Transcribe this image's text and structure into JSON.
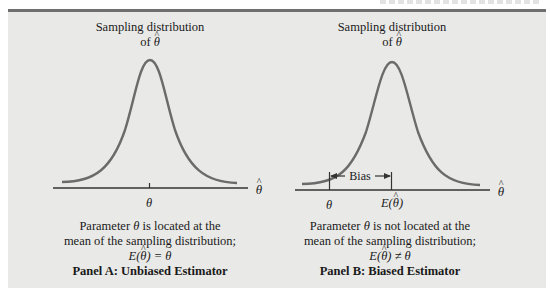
{
  "figure": {
    "background_color": "#e9e9e7",
    "rule_color": "#6f6f6f",
    "curve_color": "#6b6b6b"
  },
  "panel_a": {
    "curve_label_line1": "Sampling distribution",
    "curve_label_line2_prefix": "of",
    "symbol_theta": "θ",
    "axis_label": "θ",
    "marker_label": "θ",
    "caption_line1_prefix": "Parameter",
    "caption_line1_suffix": "is located at the",
    "caption_line2": "mean of the sampling distribution;",
    "caption_eq_lhs": "E(",
    "caption_eq_rhs": ") = θ",
    "title": "Panel A:  Unbiased Estimator"
  },
  "panel_b": {
    "curve_label_line1": "Sampling distribution",
    "curve_label_line2_prefix": "of",
    "symbol_theta": "θ",
    "axis_label": "θ",
    "marker_theta_label": "θ",
    "marker_expect_lhs": "E(",
    "marker_expect_rhs": ")",
    "bias_label": "Bias",
    "caption_line1_prefix": "Parameter",
    "caption_line1_suffix": "is not located at the",
    "caption_line2": "mean of the sampling distribution;",
    "caption_eq_lhs": "E(",
    "caption_eq_rhs": ") ≠ θ",
    "title": "Panel B:  Biased Estimator"
  }
}
